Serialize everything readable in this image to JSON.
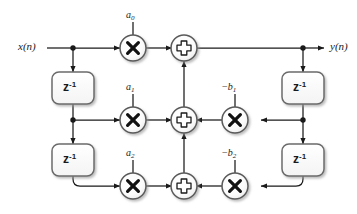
{
  "diagram": {
    "input_label": "x(n)",
    "output_label": "y(n)",
    "delay_label_base": "z",
    "delay_label_exponent": "-1",
    "colors": {
      "line": "#1a1a1a",
      "node_fill": "#ffffff",
      "node_stroke": "#5a5a5a",
      "block_stroke": "#6b6b6b",
      "shadow": "#b8b8b8",
      "text": "#1a1a1a",
      "background": "#ffffff"
    },
    "feedforward_coefficients": [
      {
        "name": "a0",
        "base": "a",
        "sub": "0",
        "sign": ""
      },
      {
        "name": "a1",
        "base": "a",
        "sub": "1",
        "sign": ""
      },
      {
        "name": "a2",
        "base": "a",
        "sub": "2",
        "sign": ""
      }
    ],
    "feedback_coefficients": [
      {
        "name": "-b1",
        "base": "b",
        "sub": "1",
        "sign": "−"
      },
      {
        "name": "-b2",
        "base": "b",
        "sub": "2",
        "sign": "−"
      }
    ],
    "delay_blocks": [
      {
        "name": "input-delay-1",
        "position": "left-upper"
      },
      {
        "name": "input-delay-2",
        "position": "left-lower"
      },
      {
        "name": "output-delay-1",
        "position": "right-upper"
      },
      {
        "name": "output-delay-2",
        "position": "right-lower"
      }
    ],
    "multiplier_glyph": "×",
    "adder_glyph": "+",
    "node_counts": {
      "multipliers": 5,
      "adders": 3,
      "delays": 4,
      "junctions": 3
    }
  }
}
